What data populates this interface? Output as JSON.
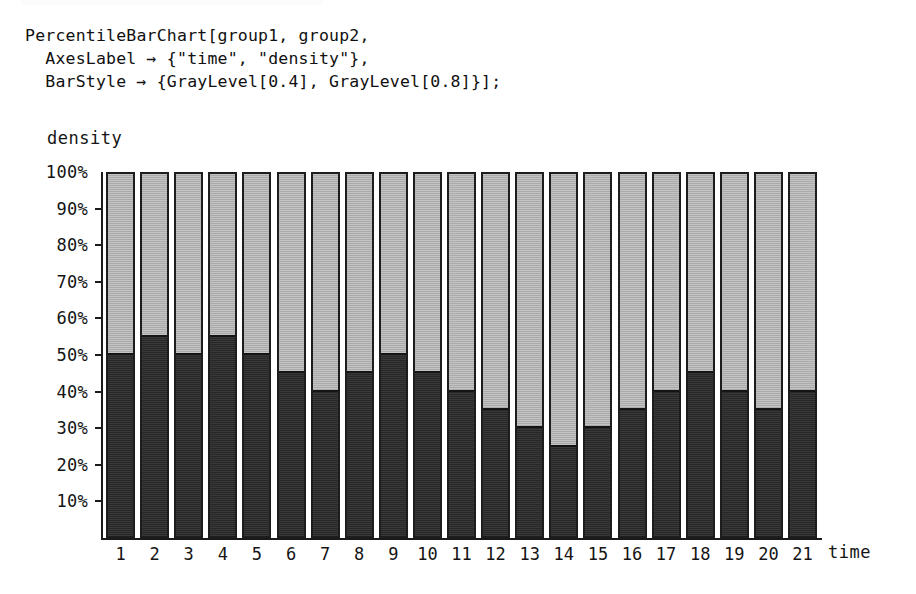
{
  "code": {
    "lines": [
      "PercentileBarChart[group1, group2,",
      "  AxesLabel → {\"time\", \"density\"},",
      "  BarStyle → {GrayLevel[0.4], GrayLevel[0.8]}];"
    ]
  },
  "axis_titles": {
    "y": "density",
    "x": "time"
  },
  "colors": {
    "lower_series": "#2a2a2a",
    "upper_series": "#bdbdbd",
    "axis": "#1a1a1a",
    "text": "#141414",
    "background": "#ffffff"
  },
  "chart_data": {
    "type": "bar",
    "title": "",
    "subtitle": "",
    "xlabel": "time",
    "ylabel": "density",
    "stacked": true,
    "percent": true,
    "grid": false,
    "legend_position": "none",
    "ylim": [
      0,
      100
    ],
    "ytick_labels": [
      "100%",
      "90%",
      "80%",
      "70%",
      "60%",
      "50%",
      "40%",
      "30%",
      "20%",
      "10%"
    ],
    "ytick_values": [
      100,
      90,
      80,
      70,
      60,
      50,
      40,
      30,
      20,
      10
    ],
    "categories": [
      "1",
      "2",
      "3",
      "4",
      "5",
      "6",
      "7",
      "8",
      "9",
      "10",
      "11",
      "12",
      "13",
      "14",
      "15",
      "16",
      "17",
      "18",
      "19",
      "20",
      "21"
    ],
    "series": [
      {
        "name": "group1",
        "style": "GrayLevel[0.4]",
        "color": "#2a2a2a",
        "values": [
          50,
          55,
          50,
          55,
          50,
          45,
          40,
          45,
          50,
          45,
          40,
          35,
          30,
          25,
          30,
          35,
          40,
          45,
          40,
          35,
          40
        ]
      },
      {
        "name": "group2",
        "style": "GrayLevel[0.8]",
        "color": "#bdbdbd",
        "values": [
          50,
          45,
          50,
          45,
          50,
          55,
          60,
          55,
          50,
          55,
          60,
          65,
          70,
          75,
          70,
          65,
          60,
          55,
          60,
          65,
          60
        ]
      }
    ]
  }
}
